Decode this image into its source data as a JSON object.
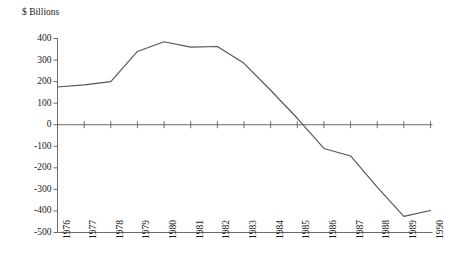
{
  "chart_data": {
    "type": "line",
    "title": "$ Billions",
    "xlabel": "",
    "ylabel": "$ Billions",
    "grid": false,
    "legend": "none",
    "xlim": [
      1976,
      1990
    ],
    "ylim": [
      -500,
      400
    ],
    "ytick_labels": [
      "400",
      "300",
      "200",
      "100",
      "0",
      "-100",
      "-200",
      "-300",
      "-400",
      "-500"
    ],
    "ytick_values": [
      400,
      300,
      200,
      100,
      0,
      -100,
      -200,
      -300,
      -400,
      -500
    ],
    "categories": [
      "1976",
      "1977",
      "1978",
      "1979",
      "1980",
      "1981",
      "1982",
      "1983",
      "1984",
      "1985",
      "1986",
      "1987",
      "1988",
      "1989",
      "1990"
    ],
    "x": [
      1976,
      1977,
      1978,
      1979,
      1980,
      1981,
      1982,
      1983,
      1984,
      1985,
      1986,
      1987,
      1988,
      1989,
      1990
    ],
    "values": [
      175,
      185,
      200,
      340,
      385,
      360,
      363,
      285,
      160,
      30,
      -110,
      -145,
      -290,
      -425,
      -398
    ],
    "series": [
      {
        "name": "$ Billions",
        "values": [
          175,
          185,
          200,
          340,
          385,
          360,
          363,
          285,
          160,
          30,
          -110,
          -145,
          -290,
          -425,
          -398
        ]
      }
    ],
    "line_color": "#555555",
    "axis_color": "#6b6b6b"
  },
  "colors": {
    "background": "#ffffff",
    "text": "#1a1a1a",
    "line": "#555555",
    "axis": "#6b6b6b"
  }
}
